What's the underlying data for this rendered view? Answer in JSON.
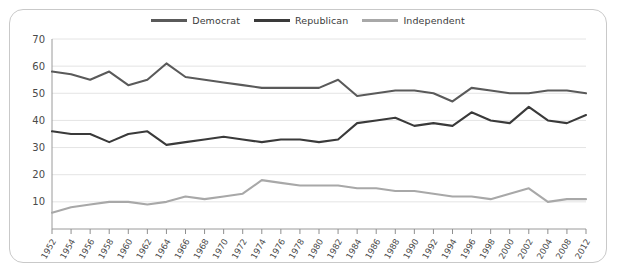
{
  "chart_data": {
    "type": "line",
    "title": "",
    "subtitle": "",
    "xlabel": "",
    "ylabel": "",
    "ylim": [
      0,
      70
    ],
    "yticks": [
      10,
      20,
      30,
      40,
      50,
      60,
      70
    ],
    "grid": true,
    "legend_position": "top-center",
    "x": [
      1952,
      1954,
      1956,
      1958,
      1960,
      1962,
      1964,
      1966,
      1968,
      1970,
      1972,
      1974,
      1976,
      1978,
      1980,
      1982,
      1984,
      1986,
      1988,
      1990,
      1992,
      1994,
      1996,
      1998,
      2000,
      2002,
      2004,
      2008,
      2012
    ],
    "categories": [
      "1952",
      "1954",
      "1956",
      "1958",
      "1960",
      "1962",
      "1964",
      "1966",
      "1968",
      "1970",
      "1972",
      "1974",
      "1976",
      "1978",
      "1980",
      "1982",
      "1984",
      "1986",
      "1988",
      "1990",
      "1992",
      "1994",
      "1996",
      "1998",
      "2000",
      "2002",
      "2004",
      "2008",
      "2012"
    ],
    "series": [
      {
        "name": "Democrat",
        "color": "#5a5a5a",
        "values": [
          58,
          57,
          55,
          58,
          53,
          55,
          61,
          56,
          55,
          54,
          53,
          52,
          52,
          52,
          52,
          55,
          49,
          50,
          51,
          51,
          50,
          47,
          52,
          51,
          50,
          50,
          51,
          51,
          50
        ]
      },
      {
        "name": "Republican",
        "color": "#3a3a3a",
        "values": [
          36,
          35,
          35,
          32,
          35,
          36,
          31,
          32,
          33,
          34,
          33,
          32,
          33,
          33,
          32,
          33,
          39,
          40,
          41,
          38,
          39,
          38,
          43,
          40,
          39,
          45,
          40,
          39,
          42
        ]
      },
      {
        "name": "Independent",
        "color": "#a8a8a8",
        "values": [
          6,
          8,
          9,
          10,
          10,
          9,
          10,
          12,
          11,
          12,
          13,
          18,
          17,
          16,
          16,
          16,
          15,
          15,
          14,
          14,
          13,
          12,
          12,
          11,
          13,
          15,
          10,
          11,
          11
        ]
      }
    ]
  },
  "legend": {
    "entries": [
      {
        "label": "Democrat"
      },
      {
        "label": "Republican"
      },
      {
        "label": "Independent"
      }
    ]
  }
}
